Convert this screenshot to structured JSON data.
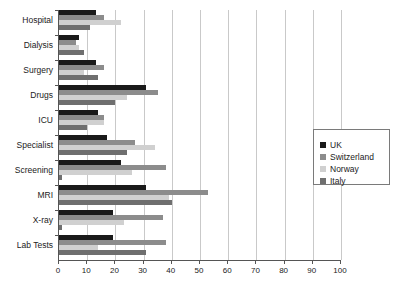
{
  "chart_data": {
    "type": "bar",
    "orientation": "horizontal",
    "title": "",
    "subtitle": "",
    "xlabel": "",
    "ylabel": "",
    "xlim": [
      0,
      100
    ],
    "xticks": [
      0,
      10,
      20,
      30,
      40,
      50,
      60,
      70,
      80,
      90,
      100
    ],
    "xtick_labels": [
      "0",
      "10",
      "20",
      "30",
      "40",
      "50",
      "60",
      "70",
      "80",
      "90",
      "100"
    ],
    "grid": true,
    "grid_axis": "x",
    "legend_position": "right",
    "categories": [
      "Hospital",
      "Dialysis",
      "Surgery",
      "Drugs",
      "ICU",
      "Specialist",
      "Screening",
      "MRI",
      "X-ray",
      "Lab Tests"
    ],
    "series": [
      {
        "name": "UK",
        "color": "#1a1a1a",
        "values": [
          13,
          7,
          13,
          31,
          14,
          17,
          22,
          31,
          19,
          19
        ]
      },
      {
        "name": "Switzerland",
        "color": "#8c8c8c",
        "values": [
          16,
          6,
          16,
          35,
          16,
          27,
          38,
          53,
          37,
          38
        ]
      },
      {
        "name": "Norway",
        "color": "#d0d0d0",
        "values": [
          22,
          7,
          9,
          24,
          16,
          34,
          26,
          39,
          23,
          14
        ]
      },
      {
        "name": "Italy",
        "color": "#6f6f6f",
        "values": [
          11,
          9,
          14,
          20,
          10,
          24,
          1,
          40,
          1,
          31
        ]
      }
    ]
  },
  "legend": {
    "entries": [
      {
        "label": "UK",
        "color": "#1a1a1a"
      },
      {
        "label": "Switzerland",
        "color": "#8c8c8c"
      },
      {
        "label": "Norway",
        "color": "#d0d0d0"
      },
      {
        "label": "Italy",
        "color": "#6f6f6f"
      }
    ]
  },
  "axes": {
    "axis_color": "#555555",
    "grid_color": "#c9c9c9"
  }
}
